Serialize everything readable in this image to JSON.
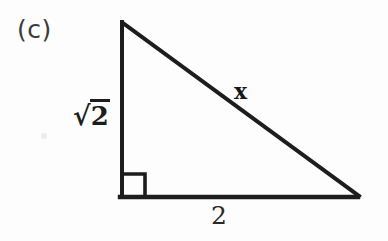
{
  "figure": {
    "part_label": "(c)",
    "ink_color": "#1d1d1d",
    "background_color": "#fdfdfd",
    "stroke_width": 4
  },
  "labels": {
    "vertical_leg": {
      "radical": "√",
      "radicand": "2",
      "full_text": "√2"
    },
    "hypotenuse": "x",
    "horizontal_leg": "2"
  },
  "geometry": {
    "type": "right-triangle",
    "vertices": {
      "top": {
        "x": 122,
        "y": 22
      },
      "bottom_left": {
        "x": 122,
        "y": 197
      },
      "bottom_right": {
        "x": 358,
        "y": 197
      }
    },
    "right_angle_marker": {
      "at_vertex": "bottom_left",
      "size": 23
    },
    "sides": [
      {
        "name": "vertical-leg",
        "label": "√2",
        "from": "top",
        "to": "bottom_left"
      },
      {
        "name": "horizontal-leg",
        "label": "2",
        "from": "bottom_left",
        "to": "bottom_right"
      },
      {
        "name": "hypotenuse",
        "label": "x",
        "from": "top",
        "to": "bottom_right"
      }
    ]
  }
}
